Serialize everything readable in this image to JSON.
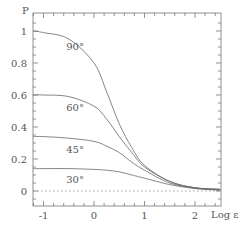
{
  "chart_data": {
    "type": "line",
    "title": "",
    "xlabel": "Log ε",
    "ylabel": "P",
    "xlim": [
      -1.3,
      2.5
    ],
    "ylim": [
      -0.1,
      1.1
    ],
    "xticks": [
      -1,
      0,
      1,
      2
    ],
    "xtick_labels": [
      "-1",
      "0",
      "1",
      "2"
    ],
    "yticks": [
      0,
      0.2,
      0.4,
      0.6,
      0.8,
      1
    ],
    "ytick_labels": [
      "0",
      "0.2",
      "0.4",
      "0.6",
      "0.8",
      "1"
    ],
    "grid": false,
    "reference_line": {
      "y": 0,
      "style": "dotted"
    },
    "series": [
      {
        "name": "90°",
        "x": [
          -1.3,
          -1.0,
          -0.5,
          0.0,
          0.25,
          0.5,
          0.75,
          1.0,
          1.5,
          2.0,
          2.5
        ],
        "values": [
          1.0,
          0.99,
          0.95,
          0.8,
          0.62,
          0.42,
          0.27,
          0.16,
          0.06,
          0.02,
          0.01
        ]
      },
      {
        "name": "60°",
        "x": [
          -1.3,
          -1.0,
          -0.5,
          0.0,
          0.25,
          0.5,
          0.75,
          1.0,
          1.5,
          2.0,
          2.5
        ],
        "values": [
          0.6,
          0.6,
          0.59,
          0.53,
          0.45,
          0.34,
          0.24,
          0.15,
          0.06,
          0.02,
          0.01
        ]
      },
      {
        "name": "45°",
        "x": [
          -1.3,
          -1.0,
          -0.5,
          0.0,
          0.25,
          0.5,
          0.75,
          1.0,
          1.5,
          2.0,
          2.5
        ],
        "values": [
          0.34,
          0.34,
          0.33,
          0.31,
          0.28,
          0.24,
          0.18,
          0.13,
          0.05,
          0.02,
          0.01
        ]
      },
      {
        "name": "30°",
        "x": [
          -1.3,
          -1.0,
          -0.5,
          0.0,
          0.25,
          0.5,
          0.75,
          1.0,
          1.5,
          2.0,
          2.5
        ],
        "values": [
          0.14,
          0.14,
          0.14,
          0.135,
          0.13,
          0.12,
          0.1,
          0.08,
          0.04,
          0.015,
          0.005
        ]
      }
    ],
    "annotations": [
      {
        "text": "90°",
        "x": -0.55,
        "y": 0.88
      },
      {
        "text": "60°",
        "x": -0.55,
        "y": 0.5
      },
      {
        "text": "45°",
        "x": -0.55,
        "y": 0.24
      },
      {
        "text": "30°",
        "x": -0.55,
        "y": 0.05
      }
    ]
  }
}
